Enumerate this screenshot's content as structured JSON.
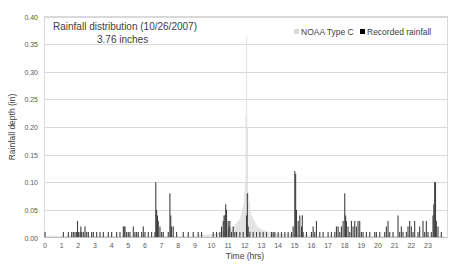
{
  "chart_data": {
    "type": "bar",
    "title": "Rainfall distribution (10/26/2007)",
    "subtitle": "3.76 inches",
    "xlabel": "Time (hrs)",
    "ylabel": "Rainfall depth (in)",
    "xlim": [
      0,
      24
    ],
    "ylim": [
      0,
      0.4
    ],
    "x_ticks": [
      "0",
      "1",
      "2",
      "3",
      "4",
      "5",
      "6",
      "7",
      "8",
      "9",
      "10",
      "11",
      "12",
      "13",
      "14",
      "15",
      "16",
      "17",
      "18",
      "19",
      "20",
      "21",
      "22",
      "23"
    ],
    "y_ticks": [
      "0.00",
      "0.05",
      "0.10",
      "0.15",
      "0.20",
      "0.25",
      "0.30",
      "0.35",
      "0.40"
    ],
    "grid": true,
    "legend_position": "top-right",
    "series": [
      {
        "name": "NOAA Type C",
        "color": "#d9d9d9",
        "interval_hrs": 0.1,
        "peak_time": 12.1,
        "peak_value": 0.365,
        "points": [
          [
            9.0,
            0.004
          ],
          [
            9.5,
            0.005
          ],
          [
            10.0,
            0.006
          ],
          [
            10.3,
            0.008
          ],
          [
            10.6,
            0.01
          ],
          [
            10.9,
            0.013
          ],
          [
            11.1,
            0.016
          ],
          [
            11.3,
            0.02
          ],
          [
            11.5,
            0.026
          ],
          [
            11.6,
            0.03
          ],
          [
            11.7,
            0.035
          ],
          [
            11.8,
            0.045
          ],
          [
            11.9,
            0.06
          ],
          [
            12.0,
            0.1
          ],
          [
            12.05,
            0.22
          ],
          [
            12.1,
            0.365
          ],
          [
            12.15,
            0.2
          ],
          [
            12.2,
            0.08
          ],
          [
            12.3,
            0.05
          ],
          [
            12.4,
            0.04
          ],
          [
            12.5,
            0.033
          ],
          [
            12.6,
            0.027
          ],
          [
            12.7,
            0.022
          ],
          [
            12.8,
            0.018
          ],
          [
            13.0,
            0.014
          ],
          [
            13.3,
            0.011
          ],
          [
            13.6,
            0.009
          ],
          [
            14.0,
            0.007
          ],
          [
            14.5,
            0.006
          ],
          [
            15.0,
            0.005
          ],
          [
            16.0,
            0.004
          ]
        ]
      },
      {
        "name": "Recorded rainfall",
        "color": "#404040",
        "points": [
          [
            0.0,
            0.01
          ],
          [
            1.1,
            0.01
          ],
          [
            1.4,
            0.01
          ],
          [
            1.6,
            0.01
          ],
          [
            1.7,
            0.01
          ],
          [
            1.8,
            0.01
          ],
          [
            1.9,
            0.01
          ],
          [
            1.95,
            0.03
          ],
          [
            2.0,
            0.01
          ],
          [
            2.1,
            0.01
          ],
          [
            2.15,
            0.02
          ],
          [
            2.2,
            0.01
          ],
          [
            2.3,
            0.01
          ],
          [
            2.4,
            0.02
          ],
          [
            2.5,
            0.01
          ],
          [
            2.6,
            0.01
          ],
          [
            2.8,
            0.01
          ],
          [
            2.9,
            0.01
          ],
          [
            3.1,
            0.01
          ],
          [
            3.3,
            0.01
          ],
          [
            3.5,
            0.01
          ],
          [
            3.8,
            0.01
          ],
          [
            4.0,
            0.01
          ],
          [
            4.3,
            0.01
          ],
          [
            4.5,
            0.01
          ],
          [
            4.7,
            0.02
          ],
          [
            4.75,
            0.02
          ],
          [
            4.8,
            0.02
          ],
          [
            4.9,
            0.01
          ],
          [
            5.0,
            0.01
          ],
          [
            5.1,
            0.01
          ],
          [
            5.3,
            0.02
          ],
          [
            5.4,
            0.01
          ],
          [
            5.5,
            0.01
          ],
          [
            5.6,
            0.01
          ],
          [
            5.8,
            0.01
          ],
          [
            5.9,
            0.02
          ],
          [
            6.0,
            0.01
          ],
          [
            6.2,
            0.01
          ],
          [
            6.4,
            0.01
          ],
          [
            6.6,
            0.01
          ],
          [
            6.65,
            0.1
          ],
          [
            6.7,
            0.05
          ],
          [
            6.75,
            0.04
          ],
          [
            6.8,
            0.03
          ],
          [
            6.9,
            0.02
          ],
          [
            7.0,
            0.01
          ],
          [
            7.1,
            0.01
          ],
          [
            7.4,
            0.01
          ],
          [
            7.5,
            0.08
          ],
          [
            7.55,
            0.04
          ],
          [
            7.6,
            0.02
          ],
          [
            7.7,
            0.02
          ],
          [
            7.9,
            0.01
          ],
          [
            8.3,
            0.01
          ],
          [
            8.6,
            0.01
          ],
          [
            8.9,
            0.01
          ],
          [
            9.2,
            0.01
          ],
          [
            9.4,
            0.01
          ],
          [
            10.1,
            0.01
          ],
          [
            10.3,
            0.01
          ],
          [
            10.5,
            0.01
          ],
          [
            10.6,
            0.02
          ],
          [
            10.7,
            0.03
          ],
          [
            10.75,
            0.04
          ],
          [
            10.8,
            0.04
          ],
          [
            10.85,
            0.06
          ],
          [
            10.9,
            0.05
          ],
          [
            11.0,
            0.03
          ],
          [
            11.05,
            0.02
          ],
          [
            11.1,
            0.03
          ],
          [
            11.2,
            0.01
          ],
          [
            11.3,
            0.02
          ],
          [
            11.4,
            0.01
          ],
          [
            11.5,
            0.01
          ],
          [
            11.7,
            0.01
          ],
          [
            11.9,
            0.01
          ],
          [
            12.1,
            0.04
          ],
          [
            12.15,
            0.08
          ],
          [
            12.2,
            0.02
          ],
          [
            12.3,
            0.01
          ],
          [
            12.5,
            0.01
          ],
          [
            12.7,
            0.01
          ],
          [
            12.9,
            0.01
          ],
          [
            13.1,
            0.01
          ],
          [
            13.3,
            0.01
          ],
          [
            13.6,
            0.01
          ],
          [
            13.7,
            0.01
          ],
          [
            13.8,
            0.01
          ],
          [
            14.0,
            0.01
          ],
          [
            14.2,
            0.01
          ],
          [
            14.4,
            0.01
          ],
          [
            14.6,
            0.01
          ],
          [
            14.8,
            0.01
          ],
          [
            14.9,
            0.02
          ],
          [
            15.0,
            0.12
          ],
          [
            15.05,
            0.115
          ],
          [
            15.1,
            0.05
          ],
          [
            15.2,
            0.03
          ],
          [
            15.3,
            0.04
          ],
          [
            15.4,
            0.02
          ],
          [
            15.45,
            0.04
          ],
          [
            15.5,
            0.01
          ],
          [
            15.7,
            0.01
          ],
          [
            16.0,
            0.01
          ],
          [
            16.1,
            0.02
          ],
          [
            16.2,
            0.01
          ],
          [
            16.3,
            0.03
          ],
          [
            16.5,
            0.01
          ],
          [
            16.7,
            0.01
          ],
          [
            17.0,
            0.01
          ],
          [
            17.2,
            0.01
          ],
          [
            17.4,
            0.01
          ],
          [
            17.5,
            0.02
          ],
          [
            17.6,
            0.02
          ],
          [
            17.7,
            0.01
          ],
          [
            17.8,
            0.02
          ],
          [
            17.9,
            0.03
          ],
          [
            18.0,
            0.08
          ],
          [
            18.05,
            0.04
          ],
          [
            18.1,
            0.03
          ],
          [
            18.2,
            0.02
          ],
          [
            18.3,
            0.01
          ],
          [
            18.4,
            0.03
          ],
          [
            18.5,
            0.02
          ],
          [
            18.6,
            0.03
          ],
          [
            18.7,
            0.02
          ],
          [
            18.8,
            0.03
          ],
          [
            18.9,
            0.03
          ],
          [
            19.0,
            0.01
          ],
          [
            19.1,
            0.01
          ],
          [
            19.3,
            0.01
          ],
          [
            19.5,
            0.01
          ],
          [
            19.8,
            0.01
          ],
          [
            19.9,
            0.01
          ],
          [
            20.1,
            0.01
          ],
          [
            20.4,
            0.01
          ],
          [
            20.5,
            0.02
          ],
          [
            20.6,
            0.03
          ],
          [
            20.7,
            0.01
          ],
          [
            20.9,
            0.01
          ],
          [
            21.2,
            0.04
          ],
          [
            21.3,
            0.01
          ],
          [
            21.4,
            0.02
          ],
          [
            21.5,
            0.01
          ],
          [
            21.7,
            0.01
          ],
          [
            21.8,
            0.02
          ],
          [
            21.9,
            0.03
          ],
          [
            22.0,
            0.02
          ],
          [
            22.1,
            0.01
          ],
          [
            22.2,
            0.03
          ],
          [
            22.4,
            0.01
          ],
          [
            22.5,
            0.02
          ],
          [
            22.7,
            0.03
          ],
          [
            22.8,
            0.01
          ],
          [
            22.9,
            0.03
          ],
          [
            23.0,
            0.01
          ],
          [
            23.2,
            0.01
          ],
          [
            23.3,
            0.04
          ],
          [
            23.35,
            0.06
          ],
          [
            23.4,
            0.1
          ],
          [
            23.45,
            0.1
          ],
          [
            23.5,
            0.03
          ],
          [
            23.6,
            0.02
          ],
          [
            23.8,
            0.01
          ]
        ]
      }
    ]
  },
  "legend": {
    "noaa_label": "NOAA Type C",
    "recorded_label": "Recorded rainfall"
  }
}
